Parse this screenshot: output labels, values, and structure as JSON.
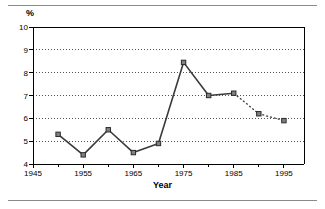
{
  "figure": {
    "unit_label": "%",
    "axis_title_x": "Year",
    "rule_color": "#8a8a8a",
    "line_color": "#3a3a3a",
    "marker_color": "#808080",
    "grid_color": "#555555",
    "axis_color": "#000000"
  },
  "chart_data": {
    "type": "line",
    "title": "",
    "xlabel": "Year",
    "ylabel": "%",
    "xlim": [
      1945,
      1999
    ],
    "ylim": [
      4,
      10
    ],
    "grid": true,
    "grid_axis": "y",
    "grid_style": "dotted",
    "legend": "none",
    "x_ticks": [
      1945,
      1955,
      1965,
      1975,
      1985,
      1995
    ],
    "x_tick_labels": [
      "1945",
      "1955",
      "1965",
      "1975",
      "1985",
      "1995"
    ],
    "x_minor_tick_interval": 5,
    "y_ticks": [
      4,
      5,
      6,
      7,
      8,
      9,
      10
    ],
    "y_tick_labels": [
      "4",
      "5",
      "6",
      "7",
      "8",
      "9",
      "10"
    ],
    "series": [
      {
        "name": "observed",
        "style": "solid",
        "marker": "square",
        "x": [
          1950,
          1955,
          1960,
          1965,
          1970,
          1975,
          1980,
          1985
        ],
        "values": [
          5.3,
          4.4,
          5.5,
          4.5,
          4.9,
          8.45,
          7.0,
          7.1
        ]
      },
      {
        "name": "projected",
        "style": "dotted",
        "marker": "square",
        "x": [
          1985,
          1990,
          1995
        ],
        "values": [
          7.1,
          6.2,
          5.9
        ]
      }
    ]
  }
}
